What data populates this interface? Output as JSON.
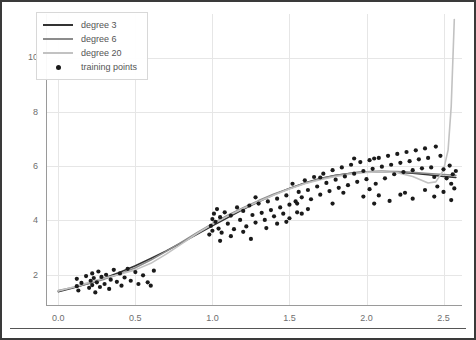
{
  "chart_data": {
    "type": "scatter",
    "title": "",
    "xlabel": "",
    "ylabel": "",
    "xlim": [
      -0.08,
      2.62
    ],
    "ylim": [
      0.85,
      11.6
    ],
    "xticks": [
      0.0,
      0.5,
      1.0,
      1.5,
      2.0,
      2.5
    ],
    "xtick_labels": [
      "0.0",
      "0.5",
      "1.0",
      "1.5",
      "2.0",
      "2.5"
    ],
    "yticks": [
      2,
      4,
      6,
      8,
      10
    ],
    "ytick_labels": [
      "2",
      "4",
      "6",
      "8",
      "10"
    ],
    "grid": true,
    "legend_position": "upper left",
    "legend": [
      {
        "label": "degree 3",
        "kind": "line",
        "color": "#333333"
      },
      {
        "label": "degree 6",
        "kind": "line",
        "color": "#8c8c8c"
      },
      {
        "label": "degree 20",
        "kind": "line",
        "color": "#c2c2c2"
      },
      {
        "label": "training points",
        "kind": "marker",
        "color": "#1a1a1a"
      }
    ],
    "series": [
      {
        "name": "degree 3",
        "kind": "line",
        "color": "#333333",
        "x": [
          0.0,
          0.1,
          0.2,
          0.3,
          0.4,
          0.5,
          0.6,
          0.7,
          0.8,
          0.9,
          1.0,
          1.1,
          1.2,
          1.3,
          1.4,
          1.5,
          1.6,
          1.7,
          1.8,
          1.9,
          2.0,
          2.1,
          2.2,
          2.3,
          2.4,
          2.5,
          2.58
        ],
        "y": [
          1.38,
          1.52,
          1.69,
          1.88,
          2.09,
          2.33,
          2.6,
          2.88,
          3.18,
          3.49,
          3.8,
          4.11,
          4.41,
          4.69,
          4.95,
          5.18,
          5.38,
          5.54,
          5.66,
          5.74,
          5.79,
          5.8,
          5.78,
          5.74,
          5.68,
          5.62,
          5.58
        ]
      },
      {
        "name": "degree 6",
        "kind": "line",
        "color": "#8c8c8c",
        "x": [
          0.0,
          0.1,
          0.2,
          0.3,
          0.4,
          0.5,
          0.6,
          0.7,
          0.8,
          0.9,
          1.0,
          1.1,
          1.2,
          1.3,
          1.4,
          1.5,
          1.6,
          1.7,
          1.8,
          1.9,
          2.0,
          2.1,
          2.2,
          2.3,
          2.4,
          2.5,
          2.58
        ],
        "y": [
          1.42,
          1.54,
          1.68,
          1.84,
          2.03,
          2.26,
          2.54,
          2.86,
          3.2,
          3.55,
          3.88,
          4.19,
          4.47,
          4.73,
          4.97,
          5.18,
          5.37,
          5.53,
          5.65,
          5.74,
          5.79,
          5.81,
          5.8,
          5.77,
          5.73,
          5.69,
          5.66
        ]
      },
      {
        "name": "degree 20",
        "kind": "line",
        "color": "#c2c2c2",
        "x": [
          0.0,
          0.1,
          0.2,
          0.3,
          0.4,
          0.5,
          0.6,
          0.7,
          0.8,
          0.9,
          1.0,
          1.1,
          1.2,
          1.3,
          1.4,
          1.5,
          1.6,
          1.7,
          1.8,
          1.9,
          2.0,
          2.1,
          2.2,
          2.3,
          2.35,
          2.4,
          2.45,
          2.5,
          2.53,
          2.55,
          2.57
        ],
        "y": [
          1.4,
          1.55,
          1.72,
          1.88,
          2.02,
          2.18,
          2.42,
          2.76,
          3.14,
          3.52,
          3.86,
          4.16,
          4.44,
          4.7,
          4.94,
          5.16,
          5.35,
          5.5,
          5.62,
          5.71,
          5.77,
          5.79,
          5.76,
          5.62,
          5.5,
          5.38,
          5.42,
          5.85,
          6.6,
          8.2,
          11.4
        ]
      }
    ],
    "scatter": {
      "name": "training points",
      "color": "#1a1a1a",
      "marker_size": 4.2,
      "points": [
        [
          0.12,
          1.58
        ],
        [
          0.12,
          1.85
        ],
        [
          0.13,
          1.42
        ],
        [
          0.15,
          1.7
        ],
        [
          0.18,
          1.95
        ],
        [
          0.2,
          1.52
        ],
        [
          0.21,
          1.78
        ],
        [
          0.22,
          2.05
        ],
        [
          0.22,
          1.62
        ],
        [
          0.23,
          1.88
        ],
        [
          0.24,
          1.35
        ],
        [
          0.25,
          1.72
        ],
        [
          0.26,
          2.12
        ],
        [
          0.27,
          1.55
        ],
        [
          0.28,
          1.92
        ],
        [
          0.3,
          1.66
        ],
        [
          0.31,
          2.0
        ],
        [
          0.33,
          1.48
        ],
        [
          0.34,
          1.82
        ],
        [
          0.36,
          2.18
        ],
        [
          0.38,
          1.74
        ],
        [
          0.4,
          2.05
        ],
        [
          0.41,
          1.6
        ],
        [
          0.43,
          1.9
        ],
        [
          0.45,
          2.22
        ],
        [
          0.47,
          1.78
        ],
        [
          0.5,
          2.1
        ],
        [
          0.52,
          1.66
        ],
        [
          0.55,
          1.98
        ],
        [
          0.58,
          1.72
        ],
        [
          0.6,
          1.6
        ],
        [
          0.62,
          2.15
        ],
        [
          0.98,
          3.48
        ],
        [
          0.99,
          3.8
        ],
        [
          1.0,
          4.05
        ],
        [
          1.0,
          3.62
        ],
        [
          1.01,
          4.25
        ],
        [
          1.02,
          3.95
        ],
        [
          1.03,
          4.42
        ],
        [
          1.04,
          3.7
        ],
        [
          1.05,
          4.12
        ],
        [
          1.06,
          3.55
        ],
        [
          1.08,
          4.3
        ],
        [
          1.1,
          3.88
        ],
        [
          1.12,
          4.18
        ],
        [
          1.14,
          3.68
        ],
        [
          1.16,
          4.48
        ],
        [
          1.18,
          4.02
        ],
        [
          1.2,
          4.35
        ],
        [
          1.22,
          3.78
        ],
        [
          1.24,
          4.55
        ],
        [
          1.25,
          3.32
        ],
        [
          1.26,
          4.2
        ],
        [
          1.28,
          3.92
        ],
        [
          1.3,
          4.62
        ],
        [
          1.32,
          4.28
        ],
        [
          1.34,
          4.02
        ],
        [
          1.36,
          4.7
        ],
        [
          1.38,
          4.38
        ],
        [
          1.4,
          4.15
        ],
        [
          1.42,
          4.8
        ],
        [
          1.44,
          4.48
        ],
        [
          1.46,
          4.25
        ],
        [
          1.48,
          4.92
        ],
        [
          1.5,
          4.58
        ],
        [
          1.52,
          5.35
        ],
        [
          1.54,
          4.7
        ],
        [
          1.55,
          4.3
        ],
        [
          1.56,
          5.05
        ],
        [
          1.58,
          4.85
        ],
        [
          1.6,
          5.48
        ],
        [
          1.62,
          5.12
        ],
        [
          1.64,
          4.78
        ],
        [
          1.66,
          5.6
        ],
        [
          1.68,
          5.25
        ],
        [
          1.7,
          4.95
        ],
        [
          1.72,
          5.72
        ],
        [
          1.74,
          5.38
        ],
        [
          1.76,
          5.08
        ],
        [
          1.78,
          5.85
        ],
        [
          1.8,
          5.5
        ],
        [
          1.82,
          5.2
        ],
        [
          1.84,
          5.95
        ],
        [
          1.86,
          5.62
        ],
        [
          1.88,
          5.3
        ],
        [
          1.9,
          6.05
        ],
        [
          1.92,
          5.72
        ],
        [
          1.94,
          5.42
        ],
        [
          1.96,
          6.15
        ],
        [
          1.98,
          5.82
        ],
        [
          2.0,
          5.52
        ],
        [
          2.02,
          6.22
        ],
        [
          2.04,
          5.9
        ],
        [
          2.05,
          4.62
        ],
        [
          2.06,
          5.35
        ],
        [
          2.08,
          6.3
        ],
        [
          2.1,
          5.98
        ],
        [
          2.12,
          5.55
        ],
        [
          2.14,
          6.38
        ],
        [
          2.16,
          6.05
        ],
        [
          2.18,
          5.7
        ],
        [
          2.2,
          6.45
        ],
        [
          2.22,
          6.12
        ],
        [
          2.24,
          5.78
        ],
        [
          2.25,
          5.02
        ],
        [
          2.26,
          6.52
        ],
        [
          2.28,
          6.18
        ],
        [
          2.3,
          5.85
        ],
        [
          2.32,
          6.58
        ],
        [
          2.34,
          6.25
        ],
        [
          2.36,
          5.92
        ],
        [
          2.38,
          6.65
        ],
        [
          2.4,
          6.3
        ],
        [
          2.42,
          5.95
        ],
        [
          2.44,
          5.6
        ],
        [
          2.45,
          6.72
        ],
        [
          2.46,
          5.25
        ],
        [
          2.48,
          6.38
        ],
        [
          2.5,
          5.88
        ],
        [
          2.52,
          5.55
        ],
        [
          2.54,
          6.02
        ],
        [
          2.55,
          5.35
        ],
        [
          2.56,
          5.7
        ],
        [
          2.57,
          5.18
        ],
        [
          2.58,
          5.82
        ],
        [
          2.05,
          6.28
        ],
        [
          2.08,
          4.92
        ],
        [
          2.15,
          4.72
        ],
        [
          2.22,
          4.95
        ],
        [
          2.3,
          4.8
        ],
        [
          2.38,
          5.12
        ],
        [
          2.44,
          4.88
        ],
        [
          2.5,
          5.05
        ],
        [
          2.55,
          4.75
        ],
        [
          1.48,
          3.95
        ],
        [
          1.55,
          4.62
        ],
        [
          1.62,
          4.42
        ],
        [
          1.7,
          5.58
        ],
        [
          1.78,
          4.62
        ],
        [
          1.85,
          5.02
        ],
        [
          1.92,
          6.28
        ],
        [
          1.98,
          4.88
        ],
        [
          2.02,
          5.15
        ],
        [
          1.35,
          3.72
        ],
        [
          1.42,
          3.88
        ],
        [
          1.5,
          4.08
        ],
        [
          1.58,
          4.25
        ],
        [
          1.05,
          3.25
        ],
        [
          1.12,
          3.42
        ],
        [
          1.2,
          3.58
        ],
        [
          1.28,
          4.85
        ]
      ]
    }
  },
  "caption": {
    "text": ""
  }
}
